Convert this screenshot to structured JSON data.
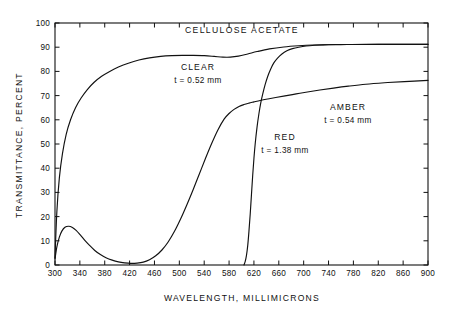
{
  "chart_data": {
    "type": "line",
    "title": "CELLULOSE ACETATE",
    "xlabel": "WAVELENGTH, MILLIMICRONS",
    "ylabel": "TRANSMITTANCE, PERCENT",
    "xlim": [
      300,
      900
    ],
    "ylim": [
      0,
      100
    ],
    "xticks": [
      300,
      340,
      380,
      420,
      460,
      500,
      540,
      580,
      620,
      660,
      700,
      740,
      780,
      820,
      860,
      900
    ],
    "yticks": [
      0,
      10,
      20,
      30,
      40,
      50,
      60,
      70,
      80,
      90,
      100
    ],
    "xtick_labels": [
      "300",
      "340",
      "380",
      "420",
      "460",
      "500",
      "540",
      "580",
      "620",
      "660",
      "700",
      "740",
      "780",
      "820",
      "860",
      "900"
    ],
    "ytick_labels": [
      "0",
      "10",
      "20",
      "30",
      "40",
      "50",
      "60",
      "70",
      "80",
      "90",
      "100"
    ],
    "grid": false,
    "legend_position": "inline-annotations",
    "series": [
      {
        "name": "CLEAR",
        "label": "CLEAR",
        "sublabel": "t = 0.52 mm",
        "color": "#111111",
        "x": [
          300,
          303,
          307,
          312,
          318,
          325,
          333,
          342,
          352,
          363,
          375,
          388,
          402,
          418,
          435,
          452,
          470,
          488,
          505,
          522,
          540,
          556,
          570,
          582,
          595,
          610,
          625,
          645,
          668,
          692,
          715,
          740,
          770,
          800,
          840,
          870,
          900
        ],
        "y": [
          3,
          22,
          36,
          46,
          54,
          60,
          65,
          69,
          72.5,
          75.5,
          78,
          80,
          81.8,
          83.4,
          84.7,
          85.6,
          86.2,
          86.5,
          86.6,
          86.6,
          86.5,
          86.2,
          85.9,
          85.9,
          86.3,
          87.2,
          88.2,
          89.3,
          90.1,
          90.6,
          90.9,
          91.0,
          91.1,
          91.1,
          91.2,
          91.2,
          91.2
        ]
      },
      {
        "name": "AMBER",
        "label": "AMBER",
        "sublabel": "t = 0.54 mm",
        "color": "#111111",
        "x": [
          300,
          303,
          307,
          311,
          316,
          322,
          328,
          334,
          341,
          348,
          356,
          364,
          373,
          382,
          392,
          402,
          412,
          422,
          432,
          442,
          452,
          462,
          472,
          482,
          492,
          502,
          512,
          522,
          532,
          542,
          552,
          562,
          572,
          580,
          588,
          596,
          604,
          612,
          620,
          630,
          642,
          655,
          670,
          688,
          706,
          726,
          748,
          772,
          800,
          830,
          862,
          900
        ],
        "y": [
          2.5,
          7.5,
          11.5,
          14,
          15.6,
          16.0,
          15.5,
          14.3,
          12.3,
          10.2,
          8.0,
          6.0,
          4.3,
          3.0,
          2.0,
          1.3,
          0.9,
          0.7,
          0.8,
          1.2,
          2.2,
          3.8,
          6.2,
          9.5,
          13.8,
          19.0,
          24.8,
          31.0,
          37.5,
          44.0,
          50.2,
          55.8,
          60.3,
          62.6,
          64.3,
          65.5,
          66.3,
          66.9,
          67.4,
          68.0,
          68.6,
          69.2,
          69.9,
          70.7,
          71.5,
          72.3,
          73.1,
          73.9,
          74.7,
          75.3,
          75.8,
          76.3
        ]
      },
      {
        "name": "RED",
        "label": "RED",
        "sublabel": "t = 1.38 mm",
        "color": "#111111",
        "x": [
          604,
          606,
          608,
          610,
          612,
          614,
          616,
          618,
          620,
          622,
          625,
          628,
          631,
          634,
          638,
          642,
          647,
          652,
          658,
          665,
          673,
          682,
          692,
          704,
          718,
          734,
          752,
          775,
          800,
          830,
          862,
          900
        ],
        "y": [
          0,
          1.5,
          4,
          8,
          14,
          21,
          29,
          37,
          44,
          50,
          57,
          62.5,
          67,
          70.5,
          74.5,
          77.8,
          81,
          83.5,
          85.5,
          87.2,
          88.5,
          89.4,
          90.0,
          90.5,
          90.8,
          91.0,
          91.1,
          91.1,
          91.2,
          91.2,
          91.2,
          91.2
        ]
      }
    ],
    "annotations": [
      {
        "name": "CLEAR",
        "line1": "CLEAR",
        "line2": "t = 0.52 mm",
        "x_px": 198,
        "y_px": 70
      },
      {
        "name": "AMBER",
        "line1": "AMBER",
        "line2": "t = 0.54 mm",
        "x_px": 348,
        "y_px": 110
      },
      {
        "name": "RED",
        "line1": "RED",
        "line2": "t = 1.38 mm",
        "x_px": 285,
        "y_px": 140
      }
    ]
  }
}
